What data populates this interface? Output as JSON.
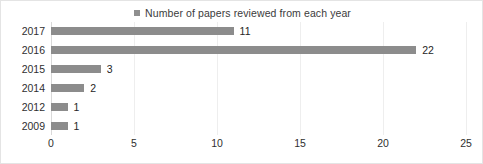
{
  "legend": {
    "marker": "legend-swatch",
    "label": "Number of papers reviewed from each year"
  },
  "chart_data": {
    "type": "bar",
    "orientation": "horizontal",
    "title": "",
    "subtitle": "",
    "xlabel": "",
    "ylabel": "",
    "categories": [
      "2017",
      "2016",
      "2015",
      "2014",
      "2012",
      "2009"
    ],
    "values": [
      11,
      22,
      3,
      2,
      1,
      1
    ],
    "data_labels": [
      "11",
      "22",
      "3",
      "2",
      "1",
      "1"
    ],
    "series": [
      {
        "name": "Number of papers reviewed from each year",
        "values": [
          11,
          22,
          3,
          2,
          1,
          1
        ],
        "color": "#8c8c8c"
      }
    ],
    "xlim": [
      0,
      25
    ],
    "xticks": [
      0,
      5,
      10,
      15,
      20,
      25
    ],
    "xtick_labels": [
      "0",
      "5",
      "10",
      "15",
      "20",
      "25"
    ],
    "grid": true,
    "grid_axis": "x",
    "grid_color": "#eeeeee",
    "legend_position": "top",
    "bar_color": "#8c8c8c",
    "frame_color": "#e4e4e4"
  }
}
